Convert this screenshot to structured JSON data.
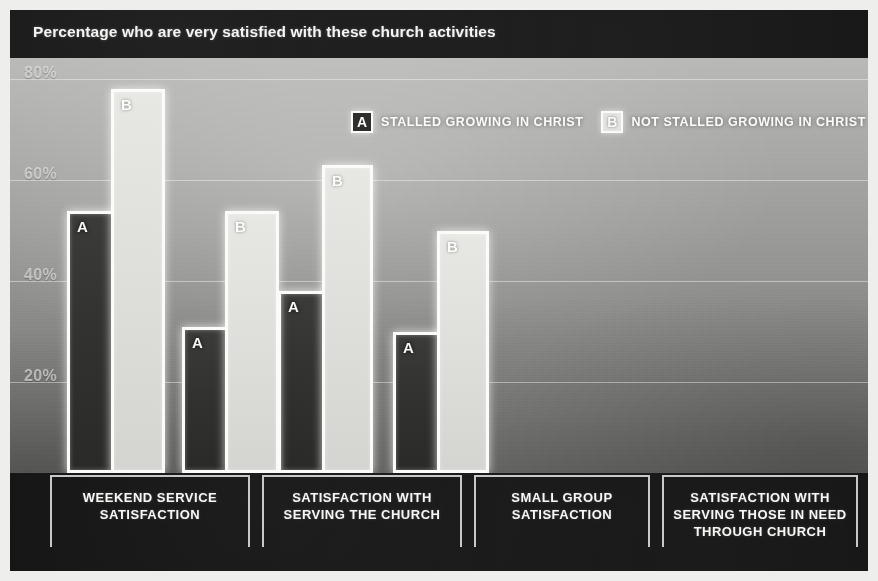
{
  "chart_data": {
    "type": "bar",
    "title": "Percentage who are very satisfied with these church activities",
    "xlabel": "",
    "ylabel": "",
    "ylim": [
      0,
      85
    ],
    "grid": true,
    "legend_position": "top-center",
    "yticks": [
      "20%",
      "40%",
      "60%",
      "80%"
    ],
    "ytick_values": [
      20,
      40,
      60,
      80
    ],
    "categories": [
      "WEEKEND SERVICE SATISFACTION",
      "SATISFACTION WITH SERVING THE CHURCH",
      "SMALL GROUP SATISFACTION",
      "SATISFACTION WITH SERVING THOSE IN NEED THROUGH CHURCH"
    ],
    "category_lines": [
      [
        "WEEKEND SERVICE",
        "SATISFACTION"
      ],
      [
        "SATISFACTION WITH",
        "SERVING THE CHURCH"
      ],
      [
        "SMALL GROUP",
        "SATISFACTION"
      ],
      [
        "SATISFACTION WITH",
        "SERVING THOSE IN NEED",
        "THROUGH CHURCH"
      ]
    ],
    "series": [
      {
        "name": "STALLED GROWING IN CHRIST",
        "tag": "A",
        "color": "#2e2e2c",
        "values": [
          50,
          27,
          34,
          26
        ]
      },
      {
        "name": "NOT STALLED GROWING IN CHRIST",
        "tag": "B",
        "color": "#e4e4e1",
        "values": [
          74,
          50,
          59,
          46
        ]
      }
    ]
  },
  "legend": {
    "items": [
      {
        "tag": "A",
        "label": "STALLED GROWING IN CHRIST"
      },
      {
        "tag": "B",
        "label": "NOT STALLED GROWING IN CHRIST"
      }
    ]
  },
  "colors": {
    "header_bg": "#161616",
    "footer_bg": "#131313",
    "bar_outline": "#fbfbf9",
    "series_a": "#2e2e2c",
    "series_b": "#e4e4e1",
    "gridline": "#ffffff"
  }
}
